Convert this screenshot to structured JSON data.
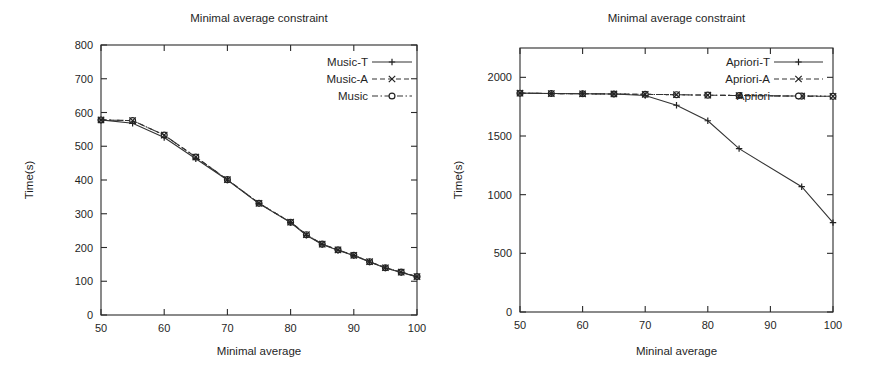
{
  "figure": {
    "panels": [
      "left",
      "right"
    ]
  },
  "chart_data": [
    {
      "id": "music-panel",
      "type": "line",
      "title": "Minimal average constraint",
      "xlabel": "Minimal average",
      "ylabel": "Time(s)",
      "xlim": [
        50,
        100
      ],
      "ylim": [
        0,
        800
      ],
      "xticks": [
        50,
        60,
        70,
        80,
        90,
        100
      ],
      "xtick_labels": [
        "50",
        "60",
        "70",
        "80",
        "90",
        "100"
      ],
      "yticks": [
        0,
        100,
        200,
        300,
        400,
        500,
        600,
        700,
        800
      ],
      "ytick_labels": [
        "0",
        "100",
        "200",
        "300",
        "400",
        "500",
        "600",
        "700",
        "800"
      ],
      "grid": false,
      "legend_position": "top-right",
      "series": [
        {
          "name": "Music-T",
          "marker": "plus",
          "linestyle": "solid",
          "x": [
            50,
            55,
            60,
            65,
            70,
            75,
            80,
            82.5,
            85,
            87.5,
            90,
            92.5,
            95,
            97.5,
            100
          ],
          "values": [
            578,
            568,
            526,
            463,
            400,
            330,
            274,
            236,
            209,
            192,
            176,
            157,
            139,
            126,
            113
          ]
        },
        {
          "name": "Music-A",
          "marker": "cross",
          "linestyle": "dashed",
          "x": [
            50,
            55,
            60,
            65,
            70,
            75,
            80,
            82.5,
            85,
            87.5,
            90,
            92.5,
            95,
            97.5,
            100
          ],
          "values": [
            578,
            576,
            533,
            468,
            401,
            331,
            275,
            238,
            210,
            193,
            177,
            158,
            140,
            127,
            114
          ]
        },
        {
          "name": "Music",
          "marker": "circle",
          "linestyle": "dashdot",
          "x": [
            50,
            55,
            60,
            65,
            70,
            75,
            80,
            82.5,
            85,
            87.5,
            90,
            92.5,
            95,
            97.5,
            100
          ],
          "values": [
            578,
            576,
            533,
            468,
            401,
            331,
            275,
            238,
            210,
            193,
            177,
            158,
            140,
            127,
            114
          ]
        }
      ]
    },
    {
      "id": "apriori-panel",
      "type": "line",
      "title": "Minimal average constraint",
      "xlabel": "Mininal average",
      "ylabel": "Time(s)",
      "xlim": [
        50,
        100
      ],
      "ylim": [
        0,
        2250
      ],
      "xticks": [
        50,
        60,
        70,
        80,
        90,
        100
      ],
      "xtick_labels": [
        "50",
        "60",
        "70",
        "80",
        "90",
        "100"
      ],
      "yticks": [
        0,
        500,
        1000,
        1500,
        2000
      ],
      "ytick_labels": [
        "0",
        "500",
        "1000",
        "1500",
        "2000"
      ],
      "grid": false,
      "legend_position": "top-right",
      "series": [
        {
          "name": "Apriori-T",
          "marker": "plus",
          "linestyle": "solid",
          "x": [
            50,
            55,
            60,
            65,
            70,
            75,
            80,
            85,
            95,
            100
          ],
          "values": [
            1865,
            1862,
            1860,
            1858,
            1845,
            1762,
            1630,
            1392,
            1068,
            762
          ]
        },
        {
          "name": "Apriori-A",
          "marker": "cross",
          "linestyle": "dashed",
          "x": [
            50,
            55,
            60,
            65,
            70,
            75,
            80,
            85,
            95,
            100
          ],
          "values": [
            1865,
            1862,
            1860,
            1858,
            1855,
            1852,
            1848,
            1845,
            1840,
            1838
          ]
        },
        {
          "name": "Apriori",
          "marker": "circle",
          "linestyle": "dashdot",
          "x": [
            50,
            55,
            60,
            65,
            70,
            75,
            80,
            85,
            95,
            100
          ],
          "values": [
            1865,
            1862,
            1860,
            1858,
            1855,
            1852,
            1848,
            1845,
            1840,
            1838
          ]
        }
      ]
    }
  ]
}
